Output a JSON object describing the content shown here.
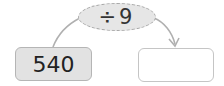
{
  "diagram": {
    "operation": "÷9",
    "input_value": "540",
    "output_value": "",
    "colors": {
      "operation_fill": "#e6e6e6",
      "input_fill": "#e2e2e2",
      "output_fill": "#ffffff",
      "stroke": "#b0b0b0"
    }
  }
}
